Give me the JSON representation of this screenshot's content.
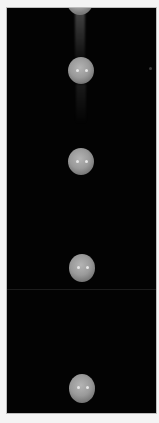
{
  "image": {
    "subject": "stroboscopic photograph of a falling ball",
    "background_color": "#030303",
    "border_color": "#f4f4f4",
    "ball_color": "#9a9a9a",
    "ball_count": 5
  }
}
